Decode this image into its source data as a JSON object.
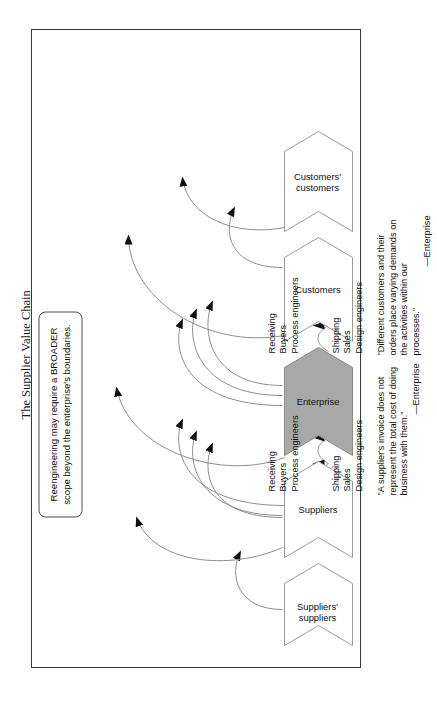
{
  "page": {
    "title": "The Supplier Value Chain"
  },
  "callout": {
    "text": "Reengineering may require a BROADER scope beyond the enterprise's boundaries."
  },
  "chevrons": [
    {
      "id": "suppliers-suppliers",
      "label": "Suppliers'\ncustomers_placeholder",
      "display": "Suppliers'\nsuppliers",
      "fill": "#ffffff",
      "stroke": "#9a9a9a"
    },
    {
      "id": "suppliers",
      "display": "Suppliers",
      "fill": "#ffffff",
      "stroke": "#9a9a9a"
    },
    {
      "id": "enterprise",
      "display": "Enterprise",
      "fill": "#a8a8a8",
      "stroke": "#8a8a8a"
    },
    {
      "id": "customers",
      "display": "Customers",
      "fill": "#ffffff",
      "stroke": "#9a9a9a"
    },
    {
      "id": "customers-customers",
      "display": "Customers'\ncustomers",
      "fill": "#ffffff",
      "stroke": "#9a9a9a"
    }
  ],
  "flows": {
    "supplier_side": {
      "outbound": "Shipping\nSales\nDesign engineers",
      "inbound": "Receiving\nBuyers\nProcess engineers"
    },
    "customer_side": {
      "outbound": "Shipping\nSales\nDesign engineers",
      "inbound": "Receiving\nBuyers\nProcess engineers"
    }
  },
  "quotes": [
    {
      "id": "supplier-quote",
      "text": "\"A supplier's invoice does not represent the total cost of doing business with them.\"",
      "attribution": "—Enterprise"
    },
    {
      "id": "customer-quote",
      "text": "\"Different customers and their orders place varying demands on the activities within our processes.\"",
      "attribution": "—Enterprise"
    }
  ],
  "colors": {
    "frame": "#3a3a3a",
    "enterprise_fill": "#a8a8a8",
    "chevron_stroke": "#9a9a9a",
    "arrow": "#111111",
    "curve": "#8d8d8d",
    "text": "#111111"
  }
}
